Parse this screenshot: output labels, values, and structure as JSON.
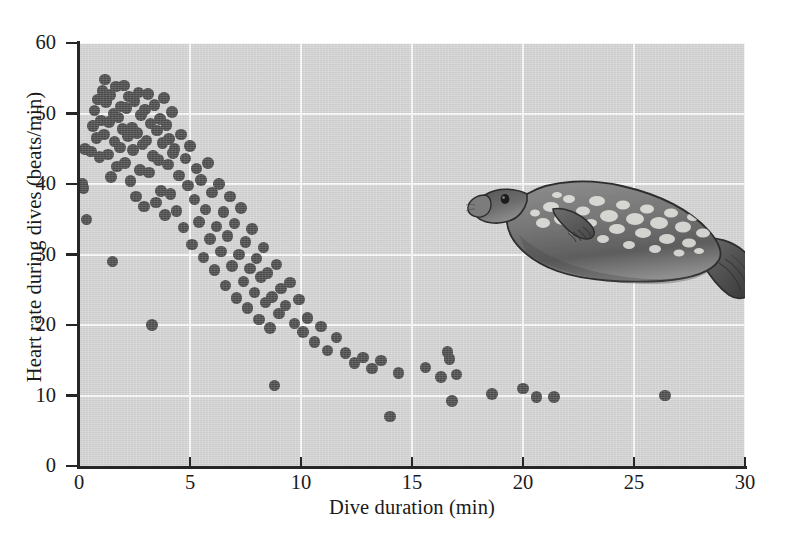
{
  "figure": {
    "background_color": "#ffffff",
    "panel_color": "#d6d6d6",
    "gridline_color": "#fbfbfb",
    "axis_color": "#262626",
    "point_color": "#4d4d4d"
  },
  "illustration": {
    "name": "seal-illustration",
    "subject": "Diving seal (Weddell / ringed seal), lateral view, spotted pelage",
    "body_color": "#6f6f6f",
    "spot_color": "#e8e8e6",
    "outline_color": "#2f2f2f"
  },
  "chart_data": {
    "type": "scatter",
    "title": "",
    "xlabel": "Dive duration (min)",
    "ylabel": "Heart rate during dives (beats/min)",
    "xlim": [
      0,
      30
    ],
    "ylim": [
      0,
      60
    ],
    "xticks": [
      0,
      5,
      10,
      15,
      20,
      25,
      30
    ],
    "yticks": [
      0,
      10,
      20,
      30,
      40,
      50,
      60
    ],
    "xticklabels": [
      "0",
      "5",
      "10",
      "15",
      "20",
      "25",
      "30"
    ],
    "yticklabels": [
      "0",
      "10",
      "20",
      "30",
      "40",
      "50",
      "60"
    ],
    "grid": true,
    "grid_color": "#ffffff",
    "legend": null,
    "marker": "circle",
    "marker_size_px": 11.5,
    "series": [
      {
        "name": "Dives",
        "points": [
          [
            0.15,
            40.0
          ],
          [
            0.2,
            39.4
          ],
          [
            0.28,
            45.0
          ],
          [
            0.33,
            35.0
          ],
          [
            0.55,
            44.6
          ],
          [
            0.62,
            48.2
          ],
          [
            0.7,
            50.4
          ],
          [
            0.78,
            46.5
          ],
          [
            0.85,
            52.0
          ],
          [
            0.92,
            43.8
          ],
          [
            0.98,
            49.0
          ],
          [
            1.05,
            53.2
          ],
          [
            1.12,
            47.0
          ],
          [
            1.18,
            54.8
          ],
          [
            1.22,
            51.6
          ],
          [
            1.3,
            44.2
          ],
          [
            1.35,
            48.8
          ],
          [
            1.4,
            52.6
          ],
          [
            1.45,
            41.0
          ],
          [
            1.5,
            29.0
          ],
          [
            1.55,
            50.0
          ],
          [
            1.6,
            46.0
          ],
          [
            1.66,
            53.8
          ],
          [
            1.72,
            42.5
          ],
          [
            1.78,
            49.4
          ],
          [
            1.84,
            45.2
          ],
          [
            1.9,
            51.0
          ],
          [
            1.96,
            47.8
          ],
          [
            2.02,
            54.0
          ],
          [
            2.08,
            43.0
          ],
          [
            2.14,
            50.8
          ],
          [
            2.2,
            46.8
          ],
          [
            2.26,
            52.4
          ],
          [
            2.32,
            40.4
          ],
          [
            2.38,
            48.0
          ],
          [
            2.44,
            44.8
          ],
          [
            2.5,
            51.8
          ],
          [
            2.56,
            38.2
          ],
          [
            2.62,
            47.2
          ],
          [
            2.68,
            53.0
          ],
          [
            2.74,
            42.0
          ],
          [
            2.8,
            49.8
          ],
          [
            2.86,
            45.6
          ],
          [
            2.92,
            36.8
          ],
          [
            2.98,
            50.6
          ],
          [
            3.04,
            46.2
          ],
          [
            3.1,
            52.8
          ],
          [
            3.16,
            41.6
          ],
          [
            3.22,
            48.6
          ],
          [
            3.28,
            20.0
          ],
          [
            3.34,
            44.0
          ],
          [
            3.4,
            51.2
          ],
          [
            3.46,
            37.4
          ],
          [
            3.52,
            47.6
          ],
          [
            3.58,
            43.4
          ],
          [
            3.64,
            49.2
          ],
          [
            3.7,
            39.0
          ],
          [
            3.76,
            45.8
          ],
          [
            3.82,
            52.2
          ],
          [
            3.88,
            35.6
          ],
          [
            3.94,
            48.4
          ],
          [
            4.0,
            42.8
          ],
          [
            4.06,
            46.4
          ],
          [
            4.12,
            38.6
          ],
          [
            4.18,
            50.2
          ],
          [
            4.24,
            44.4
          ],
          [
            4.3,
            45.0
          ],
          [
            4.4,
            36.2
          ],
          [
            4.5,
            41.2
          ],
          [
            4.6,
            47.0
          ],
          [
            4.7,
            33.8
          ],
          [
            4.8,
            43.6
          ],
          [
            4.9,
            39.8
          ],
          [
            5.0,
            45.4
          ],
          [
            5.1,
            31.4
          ],
          [
            5.2,
            37.8
          ],
          [
            5.3,
            42.2
          ],
          [
            5.4,
            34.6
          ],
          [
            5.5,
            40.6
          ],
          [
            5.6,
            29.6
          ],
          [
            5.7,
            36.4
          ],
          [
            5.8,
            43.0
          ],
          [
            5.9,
            32.2
          ],
          [
            6.0,
            38.8
          ],
          [
            6.1,
            27.8
          ],
          [
            6.2,
            34.0
          ],
          [
            6.3,
            40.0
          ],
          [
            6.4,
            30.4
          ],
          [
            6.5,
            36.0
          ],
          [
            6.6,
            25.6
          ],
          [
            6.7,
            32.6
          ],
          [
            6.8,
            38.2
          ],
          [
            6.9,
            28.4
          ],
          [
            7.0,
            34.4
          ],
          [
            7.1,
            23.8
          ],
          [
            7.2,
            30.0
          ],
          [
            7.3,
            36.6
          ],
          [
            7.4,
            26.2
          ],
          [
            7.5,
            31.8
          ],
          [
            7.6,
            22.4
          ],
          [
            7.7,
            28.0
          ],
          [
            7.8,
            33.6
          ],
          [
            7.9,
            24.6
          ],
          [
            8.0,
            29.4
          ],
          [
            8.1,
            20.8
          ],
          [
            8.2,
            26.8
          ],
          [
            8.3,
            31.0
          ],
          [
            8.4,
            23.2
          ],
          [
            8.5,
            27.4
          ],
          [
            8.6,
            19.6
          ],
          [
            8.7,
            24.0
          ],
          [
            8.8,
            11.4
          ],
          [
            8.9,
            28.6
          ],
          [
            9.0,
            21.6
          ],
          [
            9.1,
            25.2
          ],
          [
            9.3,
            22.8
          ],
          [
            9.5,
            26.0
          ],
          [
            9.7,
            20.2
          ],
          [
            9.9,
            23.6
          ],
          [
            10.1,
            19.0
          ],
          [
            10.3,
            21.0
          ],
          [
            10.6,
            17.6
          ],
          [
            10.9,
            19.8
          ],
          [
            11.2,
            16.4
          ],
          [
            11.6,
            18.2
          ],
          [
            12.0,
            16.0
          ],
          [
            12.4,
            14.6
          ],
          [
            12.8,
            15.4
          ],
          [
            13.2,
            13.8
          ],
          [
            13.6,
            15.0
          ],
          [
            14.0,
            7.0
          ],
          [
            14.4,
            13.2
          ],
          [
            15.6,
            14.0
          ],
          [
            16.3,
            12.6
          ],
          [
            16.6,
            16.2
          ],
          [
            16.7,
            15.2
          ],
          [
            16.8,
            9.2
          ],
          [
            17.0,
            13.0
          ],
          [
            18.6,
            10.2
          ],
          [
            20.0,
            11.0
          ],
          [
            20.6,
            9.8
          ],
          [
            21.4,
            9.8
          ],
          [
            26.4,
            10.0
          ]
        ]
      }
    ]
  }
}
